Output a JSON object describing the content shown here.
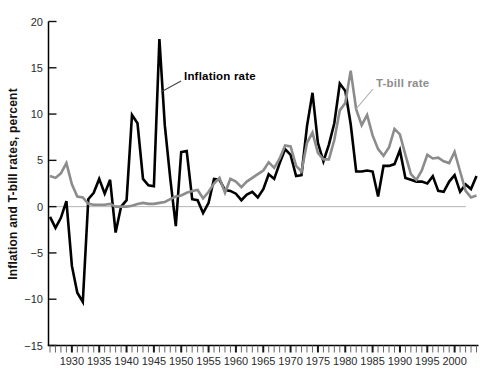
{
  "figure": {
    "background": "#ffffff"
  },
  "chart_data": {
    "type": "line",
    "title": "",
    "xlabel": "",
    "ylabel": "Inflation and T-bill rates, percent",
    "x_range": [
      1926,
      2004
    ],
    "ylim": [
      -15,
      20
    ],
    "grid": false,
    "zero_line": true,
    "zero_line_color": "#b4b4b4",
    "axis_color": "#000000",
    "tick_label_color": "#2b2b2b",
    "y_tick_values": [
      20,
      15,
      10,
      5,
      0,
      -5,
      -10,
      -15
    ],
    "y_tick_labels": [
      "20",
      "15",
      "10",
      "5",
      "0",
      "−5",
      "−10",
      "−15"
    ],
    "x_tick_years": [
      1930,
      1935,
      1940,
      1945,
      1950,
      1955,
      1960,
      1965,
      1970,
      1975,
      1980,
      1985,
      1990,
      1995,
      2000
    ],
    "x_tick_labels": [
      "1930",
      "1935",
      "1940",
      "1945",
      "1950",
      "1955",
      "1960",
      "1965",
      "1970",
      "1975",
      "1980",
      "1985",
      "1990",
      "1995",
      "2000"
    ],
    "minor_ticks_every_year": true,
    "legend_position": "inline-annotations",
    "series": [
      {
        "name": "Inflation rate",
        "color": "#000000",
        "line_width": 2.6,
        "values": [
          -1.1,
          -2.3,
          -1.2,
          0.6,
          -6.4,
          -9.3,
          -10.3,
          0.8,
          1.5,
          3.0,
          1.4,
          2.9,
          -2.8,
          0.0,
          0.7,
          9.9,
          9.0,
          3.0,
          2.3,
          2.2,
          18.1,
          8.8,
          3.0,
          -2.1,
          5.9,
          6.0,
          0.8,
          0.7,
          -0.7,
          0.4,
          3.0,
          2.9,
          1.8,
          1.7,
          1.4,
          0.7,
          1.3,
          1.6,
          1.0,
          1.9,
          3.5,
          3.0,
          4.7,
          6.2,
          5.6,
          3.3,
          3.4,
          8.7,
          12.3,
          6.9,
          4.9,
          6.7,
          9.0,
          13.3,
          12.5,
          8.9,
          3.8,
          3.8,
          3.9,
          3.8,
          1.1,
          4.4,
          4.4,
          4.6,
          6.1,
          3.1,
          2.9,
          2.7,
          2.7,
          2.5,
          3.3,
          1.7,
          1.6,
          2.7,
          3.4,
          1.6,
          2.4,
          1.9,
          3.3
        ]
      },
      {
        "name": "T-bill rate",
        "color": "#8c8c8c",
        "line_width": 2.6,
        "values": [
          3.3,
          3.1,
          3.6,
          4.7,
          2.4,
          1.1,
          1.0,
          0.3,
          0.2,
          0.2,
          0.2,
          0.3,
          0.0,
          0.0,
          0.0,
          0.1,
          0.3,
          0.4,
          0.3,
          0.3,
          0.4,
          0.5,
          0.8,
          1.1,
          1.2,
          1.5,
          1.7,
          1.8,
          0.9,
          1.6,
          2.5,
          3.1,
          1.5,
          3.0,
          2.7,
          2.1,
          2.7,
          3.1,
          3.5,
          3.9,
          4.8,
          4.2,
          5.2,
          6.6,
          6.5,
          4.4,
          3.8,
          6.9,
          8.0,
          5.8,
          5.1,
          5.1,
          7.2,
          10.4,
          11.2,
          14.7,
          10.5,
          8.8,
          9.9,
          7.7,
          6.2,
          5.5,
          6.4,
          8.4,
          7.8,
          5.6,
          3.5,
          2.9,
          3.9,
          5.6,
          5.2,
          5.3,
          4.9,
          4.7,
          5.9,
          3.8,
          1.7,
          1.0,
          1.2
        ]
      }
    ],
    "annotations": [
      {
        "text": "Inflation rate",
        "color": "#000000",
        "leader_color": "#444444",
        "text_x": 184,
        "text_y": 70,
        "leader": [
          181,
          81,
          161,
          92
        ]
      },
      {
        "text": "T-bill rate",
        "color": "#8d8d8d",
        "leader_color": "#ababab",
        "text_x": 376,
        "text_y": 77,
        "leader": [
          373,
          89,
          356,
          109
        ]
      }
    ]
  }
}
